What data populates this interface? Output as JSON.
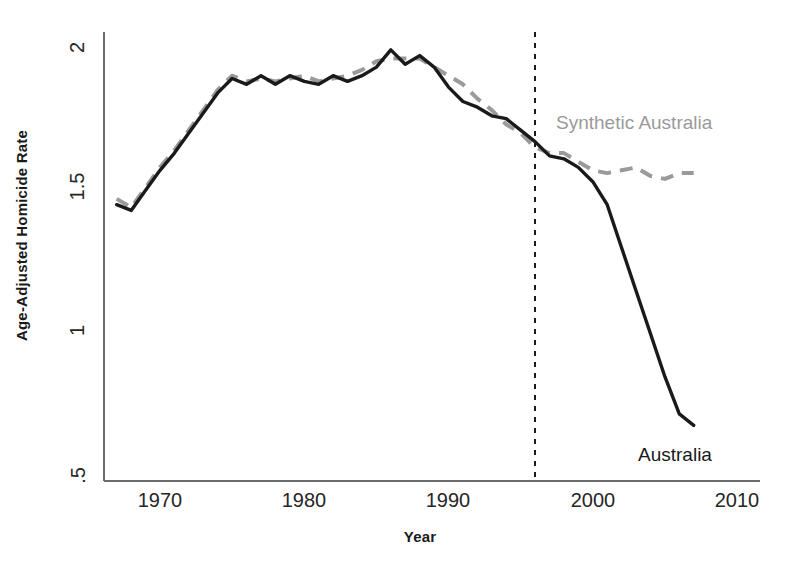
{
  "chart_data": {
    "type": "line",
    "title": "",
    "xlabel": "Year",
    "ylabel": "Age-Adjusted Homicide Rate",
    "xlim": [
      1967,
      2010
    ],
    "ylim": [
      0.5,
      2.05
    ],
    "xticks": [
      "1970",
      "1980",
      "1990",
      "2000",
      "2010"
    ],
    "xtick_values": [
      1970,
      1980,
      1990,
      2000,
      2010
    ],
    "yticks": [
      ".5",
      "1",
      "1.5",
      "2"
    ],
    "ytick_values": [
      0.5,
      1,
      1.5,
      2
    ],
    "grid": false,
    "legend_position": "inline-annotations",
    "annotations": [
      {
        "name": "treatment-line",
        "type": "vertical-dashed-line",
        "x": 1996,
        "label": ""
      }
    ],
    "x": [
      1967,
      1968,
      1969,
      1970,
      1971,
      1972,
      1973,
      1974,
      1975,
      1976,
      1977,
      1978,
      1979,
      1980,
      1981,
      1982,
      1983,
      1984,
      1985,
      1986,
      1987,
      1988,
      1989,
      1990,
      1991,
      1992,
      1993,
      1994,
      1995,
      1996,
      1997,
      1998,
      1999,
      2000,
      2001,
      2002,
      2003,
      2004,
      2005,
      2006,
      2007
    ],
    "series": [
      {
        "name": "Australia",
        "style": "solid",
        "color": "#1a1a1a",
        "values": [
          1.45,
          1.43,
          1.5,
          1.57,
          1.63,
          1.7,
          1.77,
          1.84,
          1.89,
          1.87,
          1.9,
          1.87,
          1.9,
          1.88,
          1.87,
          1.9,
          1.88,
          1.9,
          1.93,
          1.99,
          1.94,
          1.97,
          1.93,
          1.86,
          1.81,
          1.79,
          1.76,
          1.75,
          1.71,
          1.67,
          1.62,
          1.61,
          1.58,
          1.53,
          1.45,
          1.3,
          1.15,
          1.0,
          0.85,
          0.72,
          0.68
        ]
      },
      {
        "name": "Synthetic Australia",
        "style": "dashed",
        "color": "#9a9a9a",
        "values": [
          1.47,
          1.44,
          1.51,
          1.58,
          1.64,
          1.71,
          1.78,
          1.85,
          1.9,
          1.88,
          1.89,
          1.88,
          1.89,
          1.9,
          1.88,
          1.89,
          1.9,
          1.92,
          1.95,
          1.96,
          1.96,
          1.96,
          1.93,
          1.9,
          1.87,
          1.82,
          1.78,
          1.73,
          1.7,
          1.65,
          1.63,
          1.63,
          1.6,
          1.57,
          1.56,
          1.57,
          1.58,
          1.55,
          1.54,
          1.56,
          1.56
        ]
      }
    ],
    "series_labels": [
      {
        "name": "synthetic-australia-label",
        "text": "Synthetic Australia"
      },
      {
        "name": "australia-label",
        "text": "Australia"
      }
    ]
  }
}
